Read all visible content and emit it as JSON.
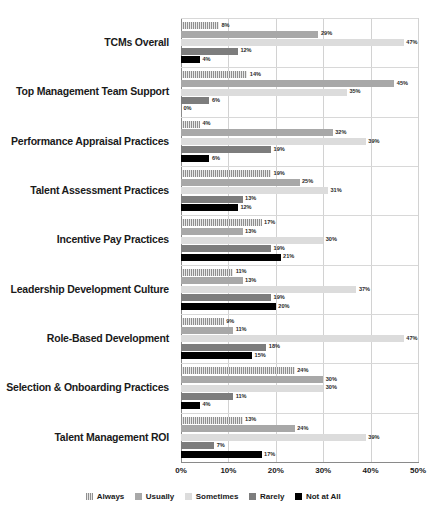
{
  "chart_data": {
    "type": "bar",
    "orientation": "horizontal",
    "title": "",
    "subtitle": "",
    "xlabel": "",
    "ylabel": "",
    "xlim": [
      0,
      50
    ],
    "xticks": [
      "0%",
      "10%",
      "20%",
      "30%",
      "40%",
      "50%"
    ],
    "xtick_values": [
      0,
      10,
      20,
      30,
      40,
      50
    ],
    "grid": true,
    "legend_position": "bottom",
    "value_suffix": "%",
    "categories": [
      "TCMs Overall",
      "Top Management Team Support",
      "Performance Appraisal Practices",
      "Talent Assessment Practices",
      "Incentive Pay Practices",
      "Leadership Development Culture",
      "Role-Based Development",
      "Selection & Onboarding Practices",
      "Talent Management ROI"
    ],
    "series": [
      {
        "name": "Always",
        "color": "#9c9c9c",
        "pattern": "vertical-stripes",
        "values": [
          8,
          14,
          4,
          19,
          17,
          11,
          9,
          24,
          13
        ],
        "labels": [
          "8%",
          "14%",
          "4%",
          "19%",
          "17%",
          "11%",
          "9%",
          "24%",
          "13%"
        ]
      },
      {
        "name": "Usually",
        "color": "#a8a8a8",
        "pattern": "solid",
        "values": [
          29,
          45,
          32,
          25,
          13,
          13,
          11,
          30,
          24
        ],
        "labels": [
          "29%",
          "45%",
          "32%",
          "25%",
          "13%",
          "13%",
          "11%",
          "30%",
          "24%"
        ]
      },
      {
        "name": "Sometimes",
        "color": "#dcdcdc",
        "pattern": "solid",
        "values": [
          47,
          35,
          39,
          31,
          30,
          37,
          47,
          30,
          39
        ],
        "labels": [
          "47%",
          "35%",
          "39%",
          "31%",
          "30%",
          "37%",
          "47%",
          "30%",
          "39%"
        ]
      },
      {
        "name": "Rarely",
        "color": "#7d7d7d",
        "pattern": "solid",
        "values": [
          12,
          6,
          19,
          13,
          19,
          19,
          18,
          11,
          7
        ],
        "labels": [
          "12%",
          "6%",
          "19%",
          "13%",
          "19%",
          "19%",
          "18%",
          "11%",
          "7%"
        ]
      },
      {
        "name": "Not at All",
        "color": "#000000",
        "pattern": "solid",
        "values": [
          4,
          0,
          6,
          12,
          21,
          20,
          15,
          4,
          17
        ],
        "labels": [
          "4%",
          "0%",
          "6%",
          "12%",
          "21%",
          "20%",
          "15%",
          "4%",
          "17%"
        ]
      }
    ]
  }
}
